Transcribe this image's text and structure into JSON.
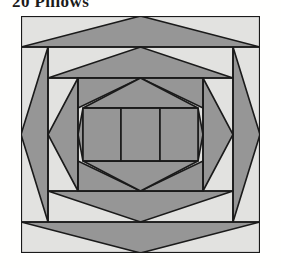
{
  "page": {
    "title": "20 Pillows",
    "background_color": "#fffffe"
  },
  "block": {
    "name": "pineapple-quilt-block",
    "frame": {
      "x": 21,
      "y": 16,
      "width": 239,
      "height": 237
    },
    "colors": {
      "light": "#e2e2e0",
      "dark": "#969696",
      "outline": "#1a1a1a",
      "background": "#ffffff"
    },
    "outline_width": 1.6,
    "geometry": {
      "view_width": 239,
      "view_height": 237,
      "center_x": 119.5,
      "center_y": 118.5,
      "rings": [
        {
          "name": "ring-1-outer",
          "top": 0,
          "bottom": 237,
          "left": 0,
          "right": 239
        },
        {
          "name": "ring-2",
          "top": 31,
          "bottom": 206,
          "left": 27,
          "right": 212
        },
        {
          "name": "ring-3",
          "top": 62,
          "bottom": 175,
          "left": 27,
          "right": 212
        },
        {
          "name": "ring-4",
          "top": 62,
          "bottom": 175,
          "left": 57,
          "right": 182
        },
        {
          "name": "ring-5",
          "top": 92,
          "bottom": 145,
          "left": 57,
          "right": 182
        },
        {
          "name": "ring-6-center",
          "top": 92,
          "bottom": 145,
          "left": 62,
          "right": 177
        }
      ],
      "center_bars": [
        {
          "name": "center-bar-left",
          "x": 62,
          "width": 38
        },
        {
          "name": "center-bar-middle",
          "x": 100,
          "width": 39
        },
        {
          "name": "center-bar-right",
          "x": 139,
          "width": 38
        }
      ]
    }
  }
}
